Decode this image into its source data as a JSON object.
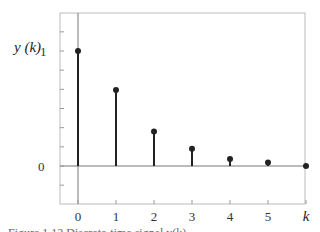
{
  "chart_data": {
    "type": "stem",
    "title": "",
    "xlabel": "k",
    "ylabel": "y (k)",
    "x": [
      0,
      1,
      2,
      3,
      4,
      5,
      6
    ],
    "values": [
      1.0,
      0.66,
      0.3,
      0.15,
      0.06,
      0.03,
      0.0
    ],
    "x_tick_labels": [
      "0",
      "1",
      "2",
      "3",
      "4",
      "5",
      "k"
    ],
    "y_tick_labels": [
      "0",
      "1"
    ],
    "ylim": [
      -0.33,
      1.33
    ],
    "xlim": [
      -0.5,
      6
    ],
    "grid": false,
    "legend": null
  },
  "labels": {
    "ylabel": "y (k)",
    "y_one": "1",
    "y_zero": "0",
    "caption": "Figure 1.12   Discrete-time signal y(k)"
  }
}
